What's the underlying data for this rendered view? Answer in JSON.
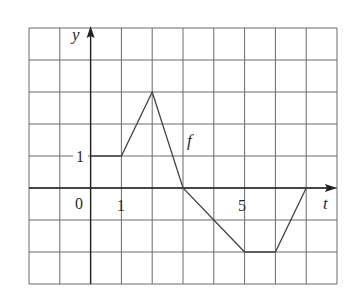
{
  "chart_data": {
    "type": "line",
    "title": "",
    "xlabel": "t",
    "ylabel": "y",
    "curve_label": "f",
    "series": [
      {
        "name": "f",
        "x": [
          0,
          1,
          2,
          3,
          5,
          6,
          7
        ],
        "y": [
          1,
          1,
          3,
          0,
          -2,
          -2,
          0
        ]
      }
    ],
    "xlim": [
      -2,
      8
    ],
    "ylim": [
      -3,
      5
    ],
    "grid": true,
    "x_tick_labels": [
      "0",
      "1",
      "5"
    ],
    "y_tick_labels": [
      "1"
    ],
    "colors": {
      "grid": "#555555",
      "axis": "#222222",
      "curve": "#444444"
    }
  },
  "labels": {
    "origin": "0",
    "x_one": "1",
    "x_five": "5",
    "y_one": "1",
    "x_axis": "t",
    "y_axis": "y",
    "curve": "f"
  }
}
